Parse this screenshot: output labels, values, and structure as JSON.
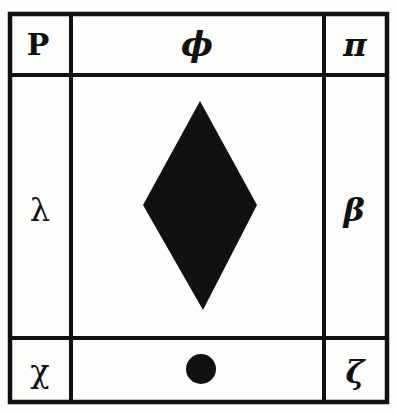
{
  "diagram": {
    "type": "3x3 symbol grid",
    "colors": {
      "ink": "#111111",
      "paper": "#fdfdfb"
    },
    "cells": {
      "top_left": {
        "symbol": "P",
        "name": "letter-p"
      },
      "top_center": {
        "symbol": "ϕ",
        "name": "phi"
      },
      "top_right": {
        "symbol": "π",
        "name": "pi"
      },
      "middle_left": {
        "symbol": "λ",
        "name": "lambda"
      },
      "middle_center": {
        "symbol": "◆",
        "name": "filled-diamond"
      },
      "middle_right": {
        "symbol": "β",
        "name": "beta"
      },
      "bottom_left": {
        "symbol": "χ",
        "name": "chi"
      },
      "bottom_center": {
        "symbol": "●",
        "name": "filled-dot"
      },
      "bottom_right": {
        "symbol": "ζ",
        "name": "zeta"
      }
    }
  }
}
